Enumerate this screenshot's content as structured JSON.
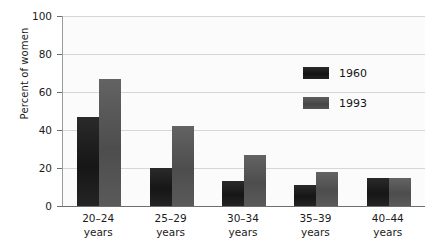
{
  "chart_data": {
    "type": "bar",
    "title": "",
    "xlabel": "",
    "ylabel": "Percent of women",
    "ylim": [
      0,
      100
    ],
    "yticks": [
      0,
      20,
      40,
      60,
      80,
      100
    ],
    "grid": true,
    "legend_position": "inside-top-right",
    "categories": [
      "20–24 years",
      "25–29 years",
      "30–34 years",
      "35–39 years",
      "40–44 years"
    ],
    "category_lines": [
      {
        "range": "20–24",
        "unit": "years"
      },
      {
        "range": "25–29",
        "unit": "years"
      },
      {
        "range": "30–34",
        "unit": "years"
      },
      {
        "range": "35–39",
        "unit": "years"
      },
      {
        "range": "40–44",
        "unit": "years"
      }
    ],
    "series": [
      {
        "name": "1960",
        "color": "#1a1a1a",
        "values": [
          47,
          20,
          13,
          11,
          15
        ]
      },
      {
        "name": "1993",
        "color": "#555555",
        "values": [
          67,
          42,
          27,
          18,
          15
        ]
      }
    ]
  },
  "axis": {
    "y_title": "Percent of women",
    "y_tick_labels": [
      "100",
      "80",
      "60",
      "40",
      "20",
      "0"
    ]
  },
  "legend": {
    "items": [
      {
        "label": "1960",
        "swatch": "legend-swatch-1960"
      },
      {
        "label": "1993",
        "swatch": "legend-swatch-1993"
      }
    ]
  }
}
